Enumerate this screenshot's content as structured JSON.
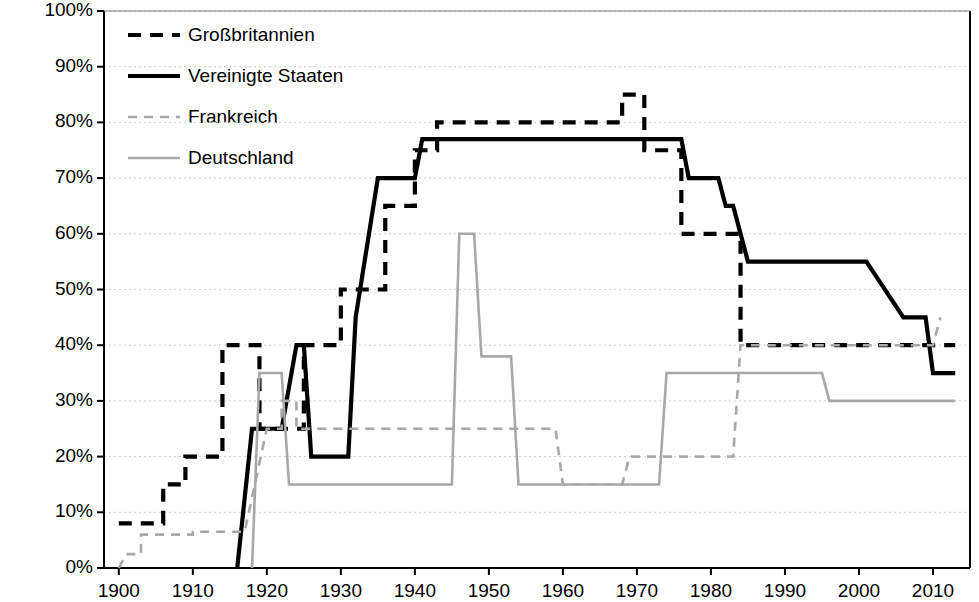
{
  "chart_data": {
    "type": "line",
    "title": "",
    "subtitle": "",
    "xlabel": "",
    "ylabel": "Spitzensteuersatz der Erbschaftssteuer",
    "xlim": [
      1898,
      2015
    ],
    "ylim": [
      0,
      100
    ],
    "grid": true,
    "grid_axis": "y",
    "legend_position": "top-left inside plot area",
    "y_unit": "%",
    "y_ticks": [
      0,
      10,
      20,
      30,
      40,
      50,
      60,
      70,
      80,
      90,
      100
    ],
    "y_tick_labels": [
      "0%",
      "10%",
      "20%",
      "30%",
      "40%",
      "50%",
      "60%",
      "70%",
      "80%",
      "90%",
      "100%"
    ],
    "x_ticks": [
      1900,
      1910,
      1920,
      1930,
      1940,
      1950,
      1960,
      1970,
      1980,
      1990,
      2000,
      2010
    ],
    "x_tick_labels": [
      "1900",
      "1910",
      "1920",
      "1930",
      "1940",
      "1950",
      "1960",
      "1970",
      "1980",
      "1990",
      "2000",
      "2010"
    ],
    "series": [
      {
        "name": "Großbritannien",
        "style": "dashed-heavy",
        "color": "#000000",
        "width": 4.2,
        "dash": "13,9",
        "points": [
          [
            1900,
            8
          ],
          [
            1906,
            8
          ],
          [
            1906,
            15
          ],
          [
            1909,
            15
          ],
          [
            1909,
            20
          ],
          [
            1914,
            20
          ],
          [
            1914,
            40
          ],
          [
            1919,
            40
          ],
          [
            1919,
            25
          ],
          [
            1925,
            25
          ],
          [
            1925,
            40
          ],
          [
            1930,
            40
          ],
          [
            1930,
            50
          ],
          [
            1936,
            50
          ],
          [
            1936,
            65
          ],
          [
            1940,
            65
          ],
          [
            1940,
            75
          ],
          [
            1943,
            75
          ],
          [
            1943,
            80
          ],
          [
            1968,
            80
          ],
          [
            1968,
            85
          ],
          [
            1971,
            85
          ],
          [
            1971,
            75
          ],
          [
            1976,
            75
          ],
          [
            1976,
            60
          ],
          [
            1984,
            60
          ],
          [
            1984,
            40
          ],
          [
            2013,
            40
          ]
        ]
      },
      {
        "name": "Vereinigte Staaten",
        "style": "solid-heavy",
        "color": "#000000",
        "width": 4.2,
        "dash": "none",
        "points": [
          [
            1916,
            0
          ],
          [
            1918,
            25
          ],
          [
            1922,
            25
          ],
          [
            1924,
            40
          ],
          [
            1925,
            40
          ],
          [
            1926,
            20
          ],
          [
            1931,
            20
          ],
          [
            1932,
            45
          ],
          [
            1935,
            70
          ],
          [
            1940,
            70
          ],
          [
            1941,
            77
          ],
          [
            1976,
            77
          ],
          [
            1977,
            70
          ],
          [
            1981,
            70
          ],
          [
            1982,
            65
          ],
          [
            1983,
            65
          ],
          [
            1985,
            55
          ],
          [
            1997,
            55
          ],
          [
            2001,
            55
          ],
          [
            2006,
            45
          ],
          [
            2009,
            45
          ],
          [
            2010,
            35
          ],
          [
            2013,
            35
          ]
        ]
      },
      {
        "name": "Frankreich",
        "style": "dashed-light",
        "color": "#a8a8a8",
        "width": 2.6,
        "dash": "9,7",
        "points": [
          [
            1900,
            0
          ],
          [
            1901,
            2.5
          ],
          [
            1903,
            2.5
          ],
          [
            1903,
            6
          ],
          [
            1910,
            6
          ],
          [
            1910,
            6.5
          ],
          [
            1917,
            6.5
          ],
          [
            1920,
            25
          ],
          [
            1922,
            25
          ],
          [
            1922,
            30
          ],
          [
            1924,
            30
          ],
          [
            1924,
            25
          ],
          [
            1959,
            25
          ],
          [
            1960,
            15
          ],
          [
            1968,
            15
          ],
          [
            1969,
            20
          ],
          [
            1983,
            20
          ],
          [
            1984,
            40
          ],
          [
            2010,
            40
          ],
          [
            2011,
            45
          ]
        ]
      },
      {
        "name": "Deutschland",
        "style": "solid-light",
        "color": "#a8a8a8",
        "width": 2.6,
        "dash": "none",
        "points": [
          [
            1918,
            0
          ],
          [
            1919,
            35
          ],
          [
            1922,
            35
          ],
          [
            1923,
            15
          ],
          [
            1945,
            15
          ],
          [
            1946,
            60
          ],
          [
            1948,
            60
          ],
          [
            1949,
            38
          ],
          [
            1953,
            38
          ],
          [
            1954,
            15
          ],
          [
            1973,
            15
          ],
          [
            1974,
            35
          ],
          [
            1995,
            35
          ],
          [
            1996,
            30
          ],
          [
            2013,
            30
          ]
        ]
      }
    ]
  },
  "axes": {
    "y_title": "Spitzensteuersatz der Erbschaftssteuer"
  },
  "legend": {
    "items": [
      {
        "label": "Großbritannien",
        "swatch": "dashed-heavy"
      },
      {
        "label": "Vereinigte Staaten",
        "swatch": "solid-heavy"
      },
      {
        "label": "Frankreich",
        "swatch": "dashed-light"
      },
      {
        "label": "Deutschland",
        "swatch": "solid-light"
      }
    ]
  },
  "colors": {
    "series_dark": "#000000",
    "series_light": "#a8a8a8",
    "grid": "#cccccc",
    "axis": "#000000",
    "background": "#ffffff"
  }
}
